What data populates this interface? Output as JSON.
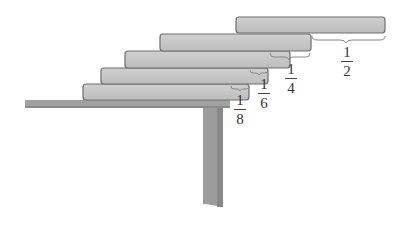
{
  "diagram": {
    "colors": {
      "block_fill": "#c4c4c4",
      "block_stroke": "#6e6e6e",
      "table_fill": "#9a9a9a",
      "brace": "#888888",
      "text": "#333333"
    },
    "blocks": [
      {
        "id": "block-1",
        "position": "bottom"
      },
      {
        "id": "block-2",
        "position": "second"
      },
      {
        "id": "block-3",
        "position": "third"
      },
      {
        "id": "block-4",
        "position": "fourth"
      },
      {
        "id": "block-5",
        "position": "top"
      }
    ],
    "overhangs": [
      {
        "numerator": "1",
        "denominator": "8"
      },
      {
        "numerator": "1",
        "denominator": "6"
      },
      {
        "numerator": "1",
        "denominator": "4"
      },
      {
        "numerator": "1",
        "denominator": "2"
      }
    ]
  }
}
